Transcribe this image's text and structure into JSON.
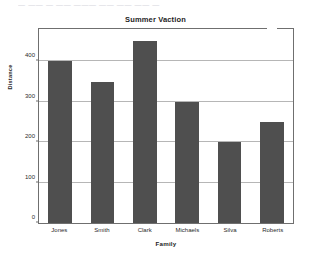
{
  "artifact": {
    "top_strip_text": "— —— — —— ——— —— —— —— —"
  },
  "colors": {
    "bar_fill": "#4f4f4f",
    "frame": "#6f6f6f",
    "gridline": "#b6b6b6",
    "background": "#ffffff",
    "text": "#1d1d1d"
  },
  "chart_data": {
    "type": "bar",
    "title": "Summer Vaction",
    "xlabel": "Family",
    "ylabel": "Distance",
    "categories": [
      "Jones",
      "Smith",
      "Clark",
      "Michaels",
      "Silva",
      "Roberts"
    ],
    "values": [
      400,
      350,
      450,
      300,
      200,
      250
    ],
    "ylim": [
      0,
      480
    ],
    "yticks": [
      0,
      100,
      200,
      300,
      400
    ],
    "ytick_labels": [
      "0",
      "100",
      "200",
      "300",
      "400"
    ],
    "grid": true,
    "legend": null,
    "legend_position": "none",
    "orientation": "vertical"
  }
}
